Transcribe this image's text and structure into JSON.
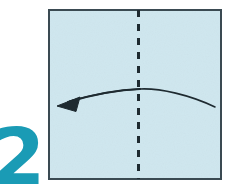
{
  "diagram": {
    "kind": "origami-fold-instruction",
    "step_number": "2",
    "step_number_color": "#1a9bb5",
    "background_color": "#ffffff",
    "paper": {
      "name": "paper-square",
      "shape": "square",
      "fill_color": "#cfe7ef",
      "border_color": "#3a4a52",
      "border_width": 2,
      "x": 48,
      "y": 9,
      "width": 174,
      "height": 171
    },
    "fold_line": {
      "name": "vertical-dashed-fold-line",
      "orientation": "vertical",
      "style": "dashed",
      "color": "#1e2a30",
      "stroke_width": 3,
      "dash_length": 7,
      "gap_length": 7,
      "x": 138,
      "y_start": 9,
      "y_end": 180
    },
    "fold_arrow": {
      "name": "fold-direction-arrow",
      "direction": "right-to-left",
      "color": "#1e2a30",
      "stroke_width": 1.6,
      "start_x": 215,
      "start_y": 107,
      "peak_x": 140,
      "peak_y": 89,
      "end_x": 70,
      "end_y": 101,
      "arrowhead": {
        "name": "arrowhead-triangle",
        "style": "solid-filled-triangle",
        "tip_x": 57,
        "tip_y": 106
      }
    }
  }
}
